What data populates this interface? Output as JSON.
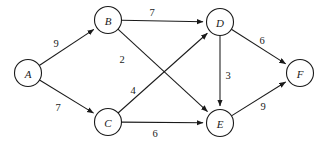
{
  "figure": {
    "kind": "weighted-directed-graph",
    "background_color": "#ffffff",
    "stroke_color": "#1a1a1a",
    "node_radius": 13.5
  },
  "nodes": [
    {
      "id": "A",
      "label": "A",
      "cx": 28,
      "cy": 73
    },
    {
      "id": "B",
      "label": "B",
      "cx": 108,
      "cy": 20
    },
    {
      "id": "C",
      "label": "C",
      "cx": 108,
      "cy": 122
    },
    {
      "id": "D",
      "label": "D",
      "cx": 220,
      "cy": 22
    },
    {
      "id": "E",
      "label": "E",
      "cx": 220,
      "cy": 123
    },
    {
      "id": "F",
      "label": "F",
      "cx": 300,
      "cy": 73
    }
  ],
  "edges": [
    {
      "id": "A-B",
      "from": "A",
      "to": "B",
      "weight": "9",
      "lx": 56,
      "ly": 43
    },
    {
      "id": "A-C",
      "from": "A",
      "to": "C",
      "weight": "7",
      "lx": 58,
      "ly": 107
    },
    {
      "id": "B-D",
      "from": "B",
      "to": "D",
      "weight": "7",
      "lx": 152,
      "ly": 12
    },
    {
      "id": "B-E",
      "from": "B",
      "to": "E",
      "weight": "2",
      "lx": 122,
      "ly": 59
    },
    {
      "id": "C-D",
      "from": "C",
      "to": "D",
      "weight": "4",
      "lx": 133,
      "ly": 90
    },
    {
      "id": "C-E",
      "from": "C",
      "to": "E",
      "weight": "6",
      "lx": 155,
      "ly": 133
    },
    {
      "id": "D-E",
      "from": "D",
      "to": "E",
      "weight": "3",
      "lx": 228,
      "ly": 75
    },
    {
      "id": "D-F",
      "from": "D",
      "to": "F",
      "weight": "6",
      "lx": 262,
      "ly": 40
    },
    {
      "id": "E-F",
      "from": "E",
      "to": "F",
      "weight": "9",
      "lx": 263,
      "ly": 106
    }
  ],
  "chart_data": {
    "type": "diagram",
    "title": "",
    "graph_type": "weighted directed graph",
    "directed": true,
    "vertices": [
      "A",
      "B",
      "C",
      "D",
      "E",
      "F"
    ],
    "edge_list": [
      {
        "source": "A",
        "target": "B",
        "weight": 9
      },
      {
        "source": "A",
        "target": "C",
        "weight": 7
      },
      {
        "source": "B",
        "target": "D",
        "weight": 7
      },
      {
        "source": "B",
        "target": "E",
        "weight": 2
      },
      {
        "source": "C",
        "target": "D",
        "weight": 4
      },
      {
        "source": "C",
        "target": "E",
        "weight": 6
      },
      {
        "source": "D",
        "target": "E",
        "weight": 3
      },
      {
        "source": "D",
        "target": "F",
        "weight": 6
      },
      {
        "source": "E",
        "target": "F",
        "weight": 9
      }
    ],
    "legend": [],
    "xlabel": "",
    "ylabel": ""
  }
}
